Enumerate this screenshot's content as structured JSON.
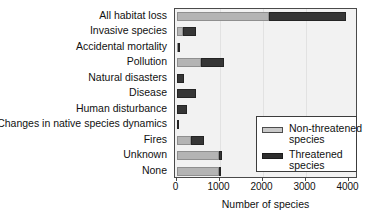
{
  "chart_data": {
    "type": "bar",
    "orientation": "horizontal",
    "stacked": true,
    "title": "",
    "xlabel": "Number of species",
    "ylabel": "",
    "xlim": [
      0,
      4000
    ],
    "xticks": [
      0,
      1000,
      2000,
      3000,
      4000
    ],
    "xtick_labels": [
      "0",
      "1000",
      "2000",
      "3000",
      "4000"
    ],
    "grid": false,
    "legend_position": "center-right",
    "categories": [
      "All habitat loss",
      "Invasive species",
      "Accidental mortality",
      "Pollution",
      "Natural disasters",
      "Disease",
      "Human disturbance",
      "Changes in native species dynamics",
      "Fires",
      "Unknown",
      "None"
    ],
    "series": [
      {
        "name": "Non-threatened species",
        "color": "#b4b4b4",
        "values": [
          2140,
          150,
          40,
          560,
          20,
          20,
          20,
          10,
          330,
          980,
          980
        ]
      },
      {
        "name": "Threatened species",
        "color": "#363636",
        "values": [
          1810,
          300,
          10,
          540,
          150,
          430,
          220,
          10,
          320,
          70,
          20
        ]
      }
    ],
    "totals": [
      3950,
      450,
      50,
      1100,
      170,
      450,
      240,
      20,
      650,
      1050,
      1000
    ],
    "legend": [
      {
        "label_line1": "Non-threatened",
        "label_line2": "species",
        "swatch": "light"
      },
      {
        "label_line1": "Threatened",
        "label_line2": "species",
        "swatch": "dark"
      }
    ]
  }
}
